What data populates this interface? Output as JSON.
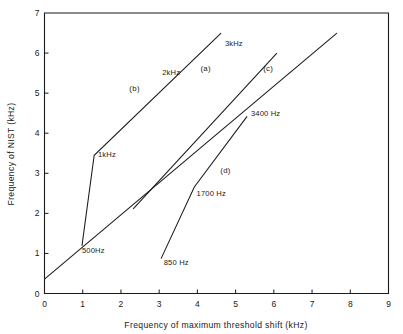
{
  "chart_data": {
    "type": "line",
    "title": "",
    "xlabel": "Frequency of maximum threshold shift   (kHz)",
    "ylabel": "Frequency of NIST   (kHz)",
    "xlim": [
      0,
      9
    ],
    "ylim": [
      0,
      7
    ],
    "xticks": [
      "0",
      "1",
      "2",
      "3",
      "4",
      "5",
      "6",
      "7",
      "8",
      "9"
    ],
    "yticks": [
      "0",
      "1",
      "2",
      "3",
      "4",
      "5",
      "6",
      "7"
    ],
    "grid": false,
    "legend_position": "inline-annotations",
    "series": [
      {
        "name": "(a)",
        "key_label": "(a)",
        "points": [
          [
            2.32,
            2.11
          ],
          [
            6.08,
            6.0
          ]
        ],
        "key_at": [
          4.08,
          5.55
        ]
      },
      {
        "name": "(b)",
        "key_label": "(b)",
        "points": [
          [
            0.98,
            1.19
          ],
          [
            1.3,
            3.45
          ],
          [
            4.62,
            6.5
          ]
        ],
        "key_at": [
          2.22,
          5.05
        ]
      },
      {
        "name": "(c)",
        "key_label": "(c)",
        "points": [
          [
            0.0,
            0.36
          ],
          [
            7.65,
            6.5
          ]
        ],
        "key_at": [
          5.72,
          5.55
        ]
      },
      {
        "name": "(d)",
        "key_label": "(d)",
        "points": [
          [
            3.05,
            0.87
          ],
          [
            3.92,
            2.66
          ],
          [
            5.3,
            4.42
          ]
        ],
        "key_at": [
          4.6,
          3.0
        ]
      }
    ],
    "annotations": [
      {
        "text": "3kHz",
        "at": [
          4.72,
          6.18
        ],
        "anchor": "start"
      },
      {
        "text": "2kHz",
        "at": [
          3.08,
          5.45
        ],
        "anchor": "start"
      },
      {
        "text": "1kHz",
        "at": [
          1.4,
          3.4
        ],
        "anchor": "start"
      },
      {
        "text": "500Hz",
        "at": [
          0.98,
          1.0
        ],
        "anchor": "start"
      },
      {
        "text": "3400 Hz",
        "at": [
          5.4,
          4.42
        ],
        "anchor": "start"
      },
      {
        "text": "1700 Hz",
        "at": [
          3.98,
          2.44
        ],
        "anchor": "start"
      },
      {
        "text": "850 Hz",
        "at": [
          3.12,
          0.72
        ],
        "anchor": "start"
      }
    ]
  }
}
